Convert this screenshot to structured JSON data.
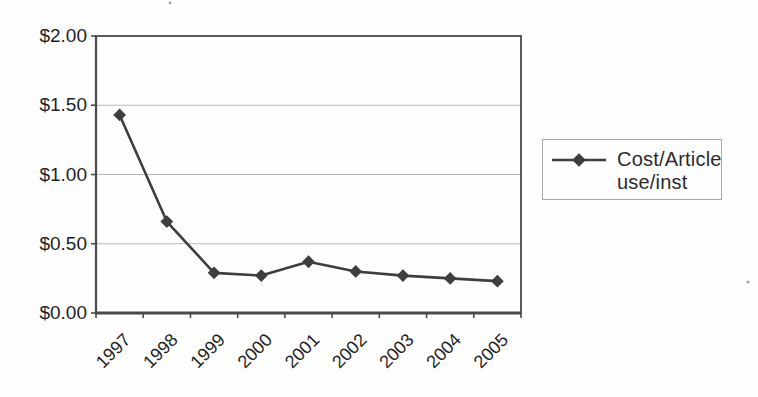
{
  "chart_data": {
    "type": "line",
    "title": "",
    "xlabel": "",
    "ylabel": "",
    "categories": [
      "1997",
      "1998",
      "1999",
      "2000",
      "2001",
      "2002",
      "2003",
      "2004",
      "2005"
    ],
    "series": [
      {
        "name": "Cost/Article use/inst",
        "values": [
          1.43,
          0.66,
          0.29,
          0.27,
          0.37,
          0.3,
          0.27,
          0.25,
          0.23
        ]
      }
    ],
    "ylim": [
      0.0,
      2.0
    ],
    "ytick_interval": 0.5,
    "ytick_labels": [
      "$0.00",
      "$0.50",
      "$1.00",
      "$1.50",
      "$2.00"
    ],
    "grid": "horizontal-gridlines-on",
    "legend_position": "right",
    "marker_style": "diamond",
    "x_tick_label_rotation_deg": 45
  },
  "legend": {
    "line1": "Cost/Article",
    "line2": "use/inst"
  },
  "colors": {
    "line": "#3e3e3e",
    "marker": "#3e3e3e",
    "axis": "#4a4a48",
    "gridline": "#b9b9b5",
    "tick": "#4a4a48",
    "label_text": "#1f1f1f",
    "legend_border": "#a9a9a4",
    "background": "#fefefe",
    "scan_artifact": "#a5a5a0"
  }
}
